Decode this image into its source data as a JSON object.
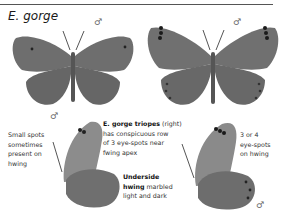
{
  "page": {
    "species_title": "E. gorge",
    "sex_symbol": "♂"
  },
  "plates": [
    {
      "id": "upperside-left",
      "sex": "♂",
      "description": "Upperside, E. gorge, small spots near forewing tips"
    },
    {
      "id": "upperside-right",
      "sex": "♂",
      "description": "Upperside, E. gorge triopes, row of 3 eye-spots near forewing apex"
    },
    {
      "id": "underside-left",
      "sex": "♂",
      "description": "Underside, E. gorge"
    },
    {
      "id": "underside-right",
      "sex": "♂",
      "description": "Underside, E. gorge triopes"
    }
  ],
  "captions": {
    "small_spots": [
      "Small spots",
      "sometimes",
      "present on",
      "hwing"
    ],
    "triopes_bold": "E. gorge triopes",
    "triopes_rest": " (right)",
    "triopes_lines": [
      "has conspicuous row",
      "of 3 eye-spots near",
      "fwing apex"
    ],
    "underside_bold_1": "Underside",
    "underside_bold_2": "hwing",
    "underside_rest_2": " marbled",
    "underside_line_3": "light and dark",
    "eye_spots": [
      "3 or 4",
      "eye-spots",
      "on hwing"
    ]
  },
  "colors": {
    "wing": "#6e6e6e",
    "wing_light": "#8a8a8a",
    "underside_fw": "#8c8c8c",
    "underside_hw": "#6f6f6f",
    "rule": "#555555"
  }
}
